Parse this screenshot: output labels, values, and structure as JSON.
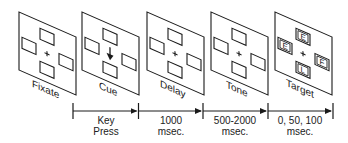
{
  "panels": [
    {
      "label": "Fixate",
      "cue_arrow": false,
      "letters": null
    },
    {
      "label": "Cue",
      "cue_arrow": true,
      "letters": null
    },
    {
      "label": "Delay",
      "cue_arrow": false,
      "letters": null
    },
    {
      "label": "Tone",
      "cue_arrow": false,
      "letters": null
    },
    {
      "label": "Target",
      "cue_arrow": false,
      "letters": {
        "top": "E",
        "left": "E",
        "right": "F",
        "bottom": "L"
      }
    }
  ],
  "timeline": {
    "intervals": [
      {
        "line1": "Key",
        "line2": "Press"
      },
      {
        "line1": "1000",
        "line2": "msec."
      },
      {
        "line1": "500-2000",
        "line2": "msec."
      },
      {
        "line1": "0, 50, 100",
        "line2": "msec."
      }
    ]
  },
  "fixation_symbol": "+",
  "colors": {
    "stroke": "#1a1a1a",
    "background": "#ffffff",
    "text": "#222222"
  }
}
